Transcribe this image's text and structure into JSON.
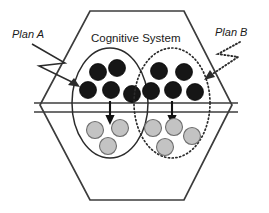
{
  "figure": {
    "type": "conceptual-diagram",
    "title": "Cognitive System",
    "background_color": "#ffffff",
    "width": 269,
    "height": 213
  },
  "labels": {
    "plan_a": "Plan A",
    "plan_b": "Plan B",
    "system_title": "Cognitive System"
  },
  "colors": {
    "outline": "#3c3c3c",
    "dark_node": "#161616",
    "light_node": "#c3c3c3",
    "light_node_stroke": "#6e6e6e",
    "text": "#1a1a1a"
  },
  "container": {
    "shape": "hexagon",
    "points": "90,11 184,11 232,105 184,200 90,200 40,105"
  },
  "membrane": {
    "line_count": 2,
    "y_top": 103,
    "y_bottom": 112,
    "x_start": 34,
    "x_end": 238
  },
  "groups": [
    {
      "id": "plan-a-group",
      "label": "Plan A",
      "border_style": "solid",
      "ellipse": {
        "cx": 110,
        "cy": 103,
        "rx": 38,
        "ry": 55
      },
      "dark_nodes": [
        {
          "cx": 98,
          "cy": 72,
          "r": 8.5
        },
        {
          "cx": 117,
          "cy": 68,
          "r": 8.5
        },
        {
          "cx": 88,
          "cy": 90,
          "r": 8.5
        },
        {
          "cx": 111,
          "cy": 90,
          "r": 8.5
        },
        {
          "cx": 132,
          "cy": 94,
          "r": 8.5
        }
      ],
      "light_nodes": [
        {
          "cx": 95,
          "cy": 130,
          "r": 8.5
        },
        {
          "cx": 120,
          "cy": 128,
          "r": 8.5
        },
        {
          "cx": 108,
          "cy": 146,
          "r": 8.5
        }
      ],
      "arrow": {
        "x": 110,
        "y_start": 101,
        "y_end": 121
      }
    },
    {
      "id": "plan-b-group",
      "label": "Plan B",
      "border_style": "dotted",
      "ellipse": {
        "cx": 172,
        "cy": 103,
        "rx": 38,
        "ry": 55
      },
      "dark_nodes": [
        {
          "cx": 159,
          "cy": 71,
          "r": 8.5
        },
        {
          "cx": 184,
          "cy": 72,
          "r": 8.5
        },
        {
          "cx": 151,
          "cy": 91,
          "r": 8.5
        },
        {
          "cx": 173,
          "cy": 90,
          "r": 8.5
        },
        {
          "cx": 195,
          "cy": 92,
          "r": 8.5
        }
      ],
      "light_nodes": [
        {
          "cx": 153,
          "cy": 128,
          "r": 8.5
        },
        {
          "cx": 174,
          "cy": 127,
          "r": 8.5
        },
        {
          "cx": 192,
          "cy": 136,
          "r": 8.5
        },
        {
          "cx": 165,
          "cy": 147,
          "r": 8.5
        }
      ],
      "arrow": {
        "x": 172,
        "y_start": 101,
        "y_end": 121
      }
    }
  ],
  "pointers": [
    {
      "id": "plan-a-pointer",
      "style": "solid-zigzag",
      "path": "M 32,44 L 65,63 L 39,66 L 76,84",
      "target": "plan-a-group"
    },
    {
      "id": "plan-b-pointer",
      "style": "dotted-zigzag",
      "path": "M 240,42 L 218,54 L 238,57 L 208,77",
      "target": "plan-b-group"
    }
  ]
}
